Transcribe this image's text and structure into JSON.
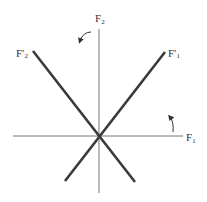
{
  "diagram": {
    "type": "axis-rotation",
    "colors": {
      "axis": "#777777",
      "rotated_axis": "#3a3a3a",
      "text": "#333333",
      "arrow": "#333333"
    },
    "axes": {
      "horizontal": {
        "label": "F",
        "subscript": "1"
      },
      "vertical": {
        "label": "F",
        "subscript": "2"
      }
    },
    "rotated_axes": [
      {
        "label": "F′",
        "subscript": "1",
        "direction": "upper-right"
      },
      {
        "label": "F′",
        "subscript": "2",
        "direction": "upper-left"
      }
    ],
    "rotation_arrows": [
      {
        "position": "near F2 axis, upper left",
        "direction": "counter-clockwise"
      },
      {
        "position": "near F1 axis, right",
        "direction": "counter-clockwise"
      }
    ]
  }
}
